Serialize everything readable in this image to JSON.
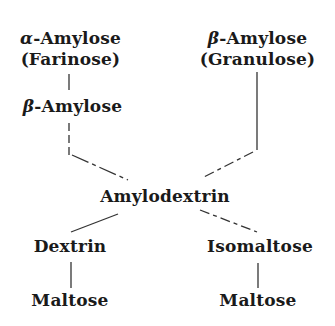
{
  "nodes": {
    "alpha_amylose": {
      "prefix": "α",
      "name": "-Amylose",
      "sub": "(Farinose)"
    },
    "beta_amylose_top": {
      "prefix": "β",
      "name": "-Amylose",
      "sub": "(Granulose)"
    },
    "beta_amylose_mid": {
      "prefix": "β",
      "name": "-Amylose"
    },
    "amylodextrin": {
      "name": "Amylodextrin"
    },
    "dextrin": {
      "name": "Dextrin"
    },
    "isomaltose": {
      "name": "Isomaltose"
    },
    "maltose_left": {
      "name": "Maltose"
    },
    "maltose_right": {
      "name": "Maltose"
    }
  },
  "edges": [
    [
      "alpha_amylose",
      "beta_amylose_mid"
    ],
    [
      "beta_amylose_mid",
      "amylodextrin"
    ],
    [
      "beta_amylose_top",
      "amylodextrin"
    ],
    [
      "amylodextrin",
      "dextrin"
    ],
    [
      "amylodextrin",
      "isomaltose"
    ],
    [
      "dextrin",
      "maltose_left"
    ],
    [
      "isomaltose",
      "maltose_right"
    ]
  ]
}
